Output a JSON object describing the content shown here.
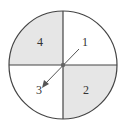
{
  "diagram": {
    "type": "spinner",
    "center": {
      "x": 63,
      "y": 65
    },
    "radius": 54,
    "colors": {
      "shaded": "#e6e6e6",
      "unshaded": "#ffffff",
      "outline": "#444444",
      "arrow": "#555555",
      "hub": "#666666",
      "label": "#333333"
    },
    "sectors": [
      {
        "label": "1",
        "position": "top-right",
        "shaded": false
      },
      {
        "label": "2",
        "position": "bottom-right",
        "shaded": true
      },
      {
        "label": "3",
        "position": "bottom-left",
        "shaded": false
      },
      {
        "label": "4",
        "position": "top-left",
        "shaded": true
      }
    ],
    "arrow": {
      "from": {
        "x": 79,
        "y": 49
      },
      "to": {
        "x": 43,
        "y": 86
      },
      "points_to": "3"
    }
  }
}
